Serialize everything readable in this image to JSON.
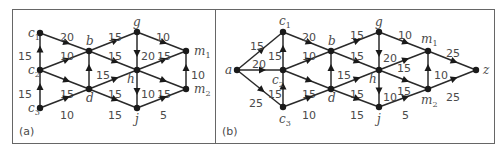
{
  "panels": [
    {
      "id": "a",
      "caption": "(a)",
      "nodes": [
        {
          "id": "c1",
          "base": "c",
          "sub": "1",
          "x": 40,
          "y": 33,
          "lx": 28,
          "ly": 37
        },
        {
          "id": "c2",
          "base": "c",
          "sub": "2",
          "x": 40,
          "y": 70,
          "lx": 28,
          "ly": 74
        },
        {
          "id": "c3",
          "base": "c",
          "sub": "3",
          "x": 40,
          "y": 108,
          "lx": 28,
          "ly": 112
        },
        {
          "id": "b",
          "base": "b",
          "sub": "",
          "x": 89,
          "y": 51,
          "lx": 86,
          "ly": 45
        },
        {
          "id": "d",
          "base": "d",
          "sub": "",
          "x": 89,
          "y": 89,
          "lx": 86,
          "ly": 102
        },
        {
          "id": "g",
          "base": "g",
          "sub": "",
          "x": 137,
          "y": 32,
          "lx": 133,
          "ly": 26
        },
        {
          "id": "h",
          "base": "h",
          "sub": "",
          "x": 137,
          "y": 70,
          "lx": 127,
          "ly": 83
        },
        {
          "id": "j",
          "base": "j",
          "sub": "",
          "x": 137,
          "y": 108,
          "lx": 135,
          "ly": 123
        },
        {
          "id": "m1",
          "base": "m",
          "sub": "1",
          "x": 186,
          "y": 51,
          "lx": 194,
          "ly": 55
        },
        {
          "id": "m2",
          "base": "m",
          "sub": "2",
          "x": 186,
          "y": 89,
          "lx": 194,
          "ly": 93
        }
      ],
      "edges": [
        {
          "from": "c2",
          "to": "c1",
          "w": "15",
          "lx": 18,
          "ly": 56
        },
        {
          "from": "c3",
          "to": "c2",
          "w": "15",
          "lx": 18,
          "ly": 94
        },
        {
          "from": "c1",
          "to": "b",
          "w": "20",
          "lx": 60,
          "ly": 37
        },
        {
          "from": "c2",
          "to": "b",
          "w": "10",
          "lx": 60,
          "ly": 56
        },
        {
          "from": "c2",
          "to": "d",
          "w": "15",
          "lx": 60,
          "ly": 94
        },
        {
          "from": "c3",
          "to": "d",
          "w": "10",
          "lx": 60,
          "ly": 115
        },
        {
          "from": "d",
          "to": "b",
          "w": "15",
          "lx": 96,
          "ly": 75
        },
        {
          "from": "b",
          "to": "g",
          "w": "15",
          "lx": 108,
          "ly": 37
        },
        {
          "from": "b",
          "to": "h",
          "w": "15",
          "lx": 108,
          "ly": 56
        },
        {
          "from": "d",
          "to": "h",
          "w": "15",
          "lx": 108,
          "ly": 94
        },
        {
          "from": "d",
          "to": "j",
          "w": "15",
          "lx": 108,
          "ly": 115
        },
        {
          "from": "g",
          "to": "h",
          "w": "20",
          "lx": 141,
          "ly": 56
        },
        {
          "from": "h",
          "to": "j",
          "w": "10",
          "lx": 141,
          "ly": 94
        },
        {
          "from": "g",
          "to": "m1",
          "w": "10",
          "lx": 156,
          "ly": 37
        },
        {
          "from": "h",
          "to": "m1",
          "w": "15",
          "lx": 157,
          "ly": 56
        },
        {
          "from": "h",
          "to": "m2",
          "w": "15",
          "lx": 157,
          "ly": 94
        },
        {
          "from": "j",
          "to": "m2",
          "w": "5",
          "lx": 160,
          "ly": 115
        },
        {
          "from": "m2",
          "to": "m1",
          "w": "10",
          "lx": 191,
          "ly": 75
        }
      ]
    },
    {
      "id": "b",
      "caption": "(b)",
      "nodes": [
        {
          "id": "a",
          "base": "a",
          "sub": "",
          "x": 237,
          "y": 70,
          "lx": 225,
          "ly": 74
        },
        {
          "id": "c1",
          "base": "c",
          "sub": "1",
          "x": 283,
          "y": 32,
          "lx": 279,
          "ly": 25
        },
        {
          "id": "c2",
          "base": "c",
          "sub": "2",
          "x": 283,
          "y": 70,
          "lx": 272,
          "ly": 84
        },
        {
          "id": "c3",
          "base": "c",
          "sub": "3",
          "x": 283,
          "y": 107,
          "lx": 279,
          "ly": 123
        },
        {
          "id": "b",
          "base": "b",
          "sub": "",
          "x": 331,
          "y": 51,
          "lx": 328,
          "ly": 45
        },
        {
          "id": "d",
          "base": "d",
          "sub": "",
          "x": 331,
          "y": 89,
          "lx": 328,
          "ly": 102
        },
        {
          "id": "g",
          "base": "g",
          "sub": "",
          "x": 379,
          "y": 32,
          "lx": 375,
          "ly": 26
        },
        {
          "id": "h",
          "base": "h",
          "sub": "",
          "x": 379,
          "y": 70,
          "lx": 369,
          "ly": 83
        },
        {
          "id": "j",
          "base": "j",
          "sub": "",
          "x": 379,
          "y": 107,
          "lx": 377,
          "ly": 123
        },
        {
          "id": "m1",
          "base": "m",
          "sub": "1",
          "x": 428,
          "y": 51,
          "lx": 421,
          "ly": 43
        },
        {
          "id": "m2",
          "base": "m",
          "sub": "2",
          "x": 428,
          "y": 89,
          "lx": 421,
          "ly": 104
        },
        {
          "id": "z",
          "base": "z",
          "sub": "",
          "x": 476,
          "y": 70,
          "lx": 483,
          "ly": 74
        }
      ],
      "edges": [
        {
          "from": "a",
          "to": "c1",
          "w": "15",
          "lx": 250,
          "ly": 46
        },
        {
          "from": "a",
          "to": "c2",
          "w": "20",
          "lx": 252,
          "ly": 64
        },
        {
          "from": "a",
          "to": "c3",
          "w": "25",
          "lx": 249,
          "ly": 103
        },
        {
          "from": "c2",
          "to": "c1",
          "w": "15",
          "lx": 268,
          "ly": 56
        },
        {
          "from": "c3",
          "to": "c2",
          "w": "15",
          "lx": 268,
          "ly": 94
        },
        {
          "from": "c1",
          "to": "b",
          "w": "20",
          "lx": 302,
          "ly": 37
        },
        {
          "from": "c2",
          "to": "b",
          "w": "10",
          "lx": 302,
          "ly": 56
        },
        {
          "from": "c2",
          "to": "d",
          "w": "15",
          "lx": 302,
          "ly": 94
        },
        {
          "from": "c3",
          "to": "d",
          "w": "10",
          "lx": 302,
          "ly": 115
        },
        {
          "from": "d",
          "to": "b",
          "w": "15",
          "lx": 337,
          "ly": 75
        },
        {
          "from": "b",
          "to": "g",
          "w": "15",
          "lx": 350,
          "ly": 35
        },
        {
          "from": "b",
          "to": "h",
          "w": "15",
          "lx": 350,
          "ly": 56
        },
        {
          "from": "d",
          "to": "h",
          "w": "15",
          "lx": 350,
          "ly": 94
        },
        {
          "from": "d",
          "to": "j",
          "w": "15",
          "lx": 350,
          "ly": 115
        },
        {
          "from": "g",
          "to": "h",
          "w": "20",
          "lx": 383,
          "ly": 58
        },
        {
          "from": "h",
          "to": "j",
          "w": "10",
          "lx": 383,
          "ly": 97
        },
        {
          "from": "g",
          "to": "m1",
          "w": "10",
          "lx": 398,
          "ly": 35
        },
        {
          "from": "h",
          "to": "m1",
          "w": "15",
          "lx": 397,
          "ly": 68
        },
        {
          "from": "h",
          "to": "m2",
          "w": "15",
          "lx": 397,
          "ly": 91
        },
        {
          "from": "j",
          "to": "m2",
          "w": "5",
          "lx": 402,
          "ly": 115
        },
        {
          "from": "m2",
          "to": "m1",
          "w": "10",
          "lx": 434,
          "ly": 75
        },
        {
          "from": "m1",
          "to": "z",
          "w": "25",
          "lx": 446,
          "ly": 53
        },
        {
          "from": "m2",
          "to": "z",
          "w": "25",
          "lx": 446,
          "ly": 97
        }
      ]
    }
  ],
  "frame": {
    "x": 12,
    "y": 9,
    "w": 482,
    "h": 134,
    "divider_x": 215
  },
  "captions": {
    "a": {
      "x": 19,
      "y": 135
    },
    "b": {
      "x": 222,
      "y": 135
    }
  }
}
